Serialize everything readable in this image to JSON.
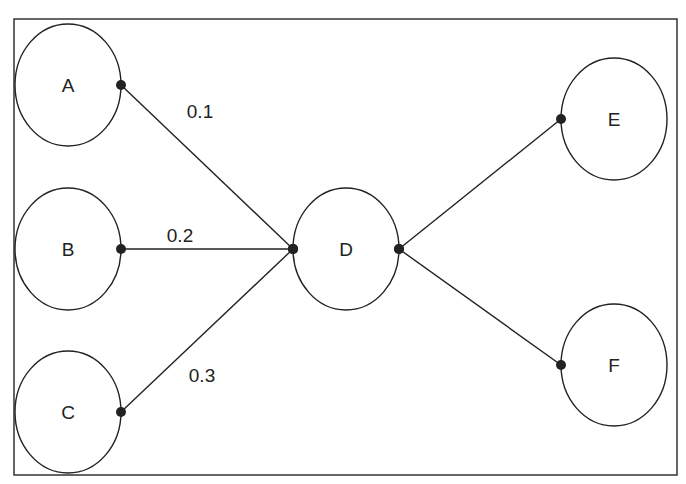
{
  "diagram": {
    "type": "weighted-graph",
    "frame": {
      "x": 14,
      "y": 19,
      "w": 663,
      "h": 456
    },
    "nodes": [
      {
        "id": "A",
        "label": "A",
        "cx": 68,
        "cy": 85,
        "rx": 53,
        "ry": 61
      },
      {
        "id": "B",
        "label": "B",
        "cx": 68,
        "cy": 249,
        "rx": 53,
        "ry": 61
      },
      {
        "id": "C",
        "label": "C",
        "cx": 68,
        "cy": 412,
        "rx": 53,
        "ry": 61
      },
      {
        "id": "D",
        "label": "D",
        "cx": 346,
        "cy": 249,
        "rx": 53,
        "ry": 61
      },
      {
        "id": "E",
        "label": "E",
        "cx": 614,
        "cy": 119,
        "rx": 53,
        "ry": 61
      },
      {
        "id": "F",
        "label": "F",
        "cx": 614,
        "cy": 365,
        "rx": 53,
        "ry": 61
      }
    ],
    "edges": [
      {
        "from": "A",
        "to": "D",
        "label": "0.1",
        "x1": 121,
        "y1": 85,
        "x2": 293,
        "y2": 249,
        "lx": 200,
        "ly": 118
      },
      {
        "from": "B",
        "to": "D",
        "label": "0.2",
        "x1": 121,
        "y1": 249,
        "x2": 293,
        "y2": 249,
        "lx": 180,
        "ly": 242
      },
      {
        "from": "C",
        "to": "D",
        "label": "0.3",
        "x1": 121,
        "y1": 412,
        "x2": 293,
        "y2": 249,
        "lx": 202,
        "ly": 382
      },
      {
        "from": "D",
        "to": "E",
        "label": "",
        "x1": 399,
        "y1": 249,
        "x2": 561,
        "y2": 119
      },
      {
        "from": "D",
        "to": "F",
        "label": "",
        "x1": 399,
        "y1": 249,
        "x2": 561,
        "y2": 365
      }
    ],
    "colors": {
      "stroke": "#222222",
      "background": "#ffffff"
    }
  }
}
